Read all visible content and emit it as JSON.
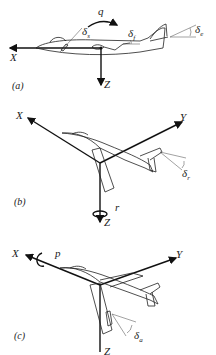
{
  "figure": {
    "panels": [
      {
        "id": "a",
        "label": "(a)",
        "axes": [
          "X",
          "Z"
        ],
        "rotation": {
          "symbol": "q",
          "name": "pitch rate"
        },
        "deflections": [
          {
            "symbol": "δ",
            "sub": "s",
            "name": "stabilizer"
          },
          {
            "symbol": "δ",
            "sub": "f",
            "name": "flap"
          },
          {
            "symbol": "δ",
            "sub": "e",
            "name": "elevator"
          }
        ]
      },
      {
        "id": "b",
        "label": "(b)",
        "axes": [
          "X",
          "Y",
          "Z"
        ],
        "rotation": {
          "symbol": "r",
          "name": "yaw rate"
        },
        "deflections": [
          {
            "symbol": "δ",
            "sub": "r",
            "name": "rudder"
          }
        ]
      },
      {
        "id": "c",
        "label": "(c)",
        "axes": [
          "X",
          "Y",
          "Z"
        ],
        "rotation": {
          "symbol": "p",
          "name": "roll rate"
        },
        "deflections": [
          {
            "symbol": "δ",
            "sub": "a",
            "name": "aileron"
          }
        ]
      }
    ]
  },
  "colors": {
    "ink": "#1a1a1a",
    "background": "#ffffff"
  }
}
